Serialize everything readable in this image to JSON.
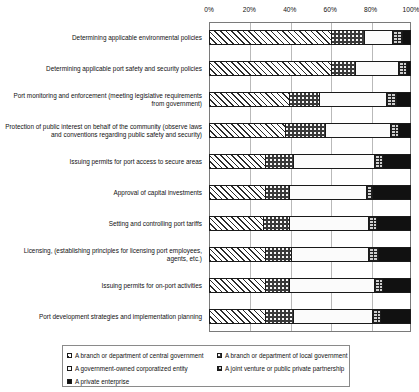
{
  "chart_data": {
    "type": "bar",
    "orientation": "horizontal",
    "stacked": true,
    "stack_mode": "percent",
    "title": "",
    "xlabel": "",
    "ylabel": "",
    "xlim": [
      0,
      100
    ],
    "grid": true,
    "legend_position": "bottom",
    "tick_labels": [
      "0%",
      "20%",
      "40%",
      "60%",
      "80%",
      "100%"
    ],
    "tick_values": [
      0,
      20,
      40,
      60,
      80,
      100
    ],
    "categories": [
      "Determining applicable environmental policies",
      "Determining applicable port safety and security policies",
      "Port monitoring and enforcement (meeting legislative requirements from government)",
      "Protection of public interest on behalf of the community (observe laws and conventions regarding public safety and security)",
      "Issuing permits for port access to secure areas",
      "Approval of capital investments",
      "Setting and controlling port tariffs",
      "Licensing, (establishing principles for licensing port employees, agents, etc.)",
      "Issuing permits for on-port activities",
      "Port development strategies and implementation planning"
    ],
    "series": [
      {
        "name": "A branch or department of central government",
        "pattern": "hatch",
        "values": [
          61,
          61,
          40,
          38,
          28,
          28,
          27,
          28,
          28,
          28
        ]
      },
      {
        "name": "A branch or department of local government",
        "pattern": "dots",
        "values": [
          16,
          12,
          15,
          20,
          14,
          12,
          13,
          13,
          12,
          14
        ]
      },
      {
        "name": "A government-owned corporatized entity",
        "pattern": "white",
        "values": [
          14,
          21,
          33,
          32,
          40,
          38,
          39,
          38,
          42,
          39
        ]
      },
      {
        "name": "A joint venture or public private partnership",
        "pattern": "brick",
        "values": [
          5,
          4,
          5,
          4,
          4,
          3,
          4,
          5,
          4,
          4
        ]
      },
      {
        "name": "A private enterprise",
        "pattern": "black",
        "values": [
          4,
          2,
          7,
          6,
          14,
          19,
          17,
          16,
          14,
          15
        ]
      }
    ]
  },
  "legend": {
    "items": [
      {
        "label": "A branch or department of central government",
        "pattern": "hatch",
        "column": "left"
      },
      {
        "label": "A government-owned corporatized entity",
        "pattern": "white",
        "column": "left"
      },
      {
        "label": "A private enterprise",
        "pattern": "black",
        "column": "left"
      },
      {
        "label": "A branch or department of local government",
        "pattern": "dots",
        "column": "right"
      },
      {
        "label": "A joint venture or public private partnership",
        "pattern": "brick",
        "column": "right"
      }
    ]
  }
}
